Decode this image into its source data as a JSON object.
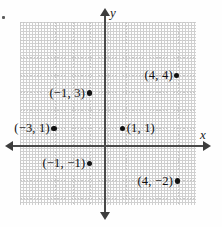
{
  "figure": {
    "type": "coordinate-plane",
    "axes": {
      "x_label": "x",
      "y_label": "y",
      "origin_px": [
        105,
        146
      ],
      "grid_spacing_px": 17.6,
      "grid_columns": 10,
      "grid_rows": 10,
      "x_range": [
        -5,
        5
      ],
      "y_range": [
        -5,
        5
      ],
      "grid_visible": true,
      "grid_style": "dotted",
      "grid_color": "#c4c4c4",
      "axis_color": "#4a4a4a",
      "arrowheads": [
        "left",
        "right",
        "up",
        "down"
      ]
    },
    "points": [
      {
        "label": "(4, 4)",
        "x": 4,
        "y": 4,
        "dot_side": "right"
      },
      {
        "label": "(−1, 3)",
        "x": -1,
        "y": 3,
        "dot_side": "right"
      },
      {
        "label": "(−3, 1)",
        "x": -3,
        "y": 1,
        "dot_side": "right"
      },
      {
        "label": "(1, 1)",
        "x": 1,
        "y": 1,
        "dot_side": "left"
      },
      {
        "label": "(−1, −1)",
        "x": -1,
        "y": -1,
        "dot_side": "right"
      },
      {
        "label": "(4, −2)",
        "x": 4,
        "y": -2,
        "dot_side": "right"
      }
    ],
    "colors": {
      "background": "#fefefe",
      "point": "#111111",
      "text": "#111111"
    }
  }
}
